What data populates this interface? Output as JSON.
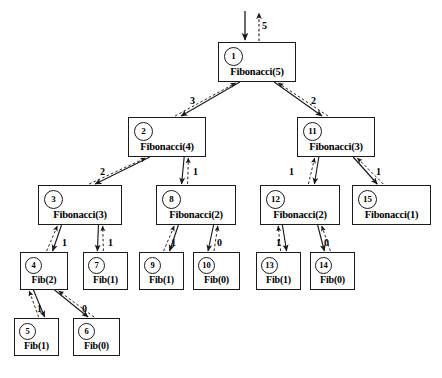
{
  "diagram": {
    "root_edge": {
      "label": "5",
      "call_direction": "down",
      "return_direction": "up"
    },
    "colors": {
      "stroke": "#1a1a1a",
      "background": "#ffffff",
      "text": "#000000"
    },
    "nodes": [
      {
        "id": "n1",
        "index": "1",
        "label": "Fibonacci(5)",
        "x": 218,
        "y": 42,
        "w": 78,
        "h": 40,
        "size": "big"
      },
      {
        "id": "n2",
        "index": "2",
        "label": "Fibonacci(4)",
        "x": 128,
        "y": 117,
        "w": 78,
        "h": 40,
        "size": "big"
      },
      {
        "id": "n11",
        "index": "11",
        "label": "Fibonacci(3)",
        "x": 297,
        "y": 117,
        "w": 78,
        "h": 40,
        "size": "big"
      },
      {
        "id": "n3",
        "index": "3",
        "label": "Fibonacci(3)",
        "x": 38,
        "y": 185,
        "w": 84,
        "h": 40,
        "size": "big"
      },
      {
        "id": "n8",
        "index": "8",
        "label": "Fibonacci(2)",
        "x": 156,
        "y": 185,
        "w": 80,
        "h": 40,
        "size": "big"
      },
      {
        "id": "n12",
        "index": "12",
        "label": "Fibonacci(2)",
        "x": 260,
        "y": 185,
        "w": 80,
        "h": 40,
        "size": "big"
      },
      {
        "id": "n15",
        "index": "15",
        "label": "Fibonacci(1)",
        "x": 352,
        "y": 185,
        "w": 79,
        "h": 40,
        "size": "big"
      },
      {
        "id": "n4",
        "index": "4",
        "label": "Fib(2)",
        "x": 20,
        "y": 252,
        "w": 48,
        "h": 38,
        "size": "small"
      },
      {
        "id": "n7",
        "index": "7",
        "label": "Fib(1)",
        "x": 83,
        "y": 252,
        "w": 45,
        "h": 38,
        "size": "small"
      },
      {
        "id": "n9",
        "index": "9",
        "label": "Fib(1)",
        "x": 139,
        "y": 252,
        "w": 45,
        "h": 38,
        "size": "small"
      },
      {
        "id": "n10",
        "index": "10",
        "label": "Fib(0)",
        "x": 193,
        "y": 252,
        "w": 47,
        "h": 38,
        "size": "small"
      },
      {
        "id": "n13",
        "index": "13",
        "label": "Fib(1)",
        "x": 256,
        "y": 252,
        "w": 45,
        "h": 38,
        "size": "small"
      },
      {
        "id": "n14",
        "index": "14",
        "label": "Fib(0)",
        "x": 310,
        "y": 252,
        "w": 45,
        "h": 38,
        "size": "small"
      },
      {
        "id": "n5",
        "index": "5",
        "label": "Fib(1)",
        "x": 14,
        "y": 318,
        "w": 45,
        "h": 38,
        "size": "small"
      },
      {
        "id": "n6",
        "index": "6",
        "label": "Fib(0)",
        "x": 73,
        "y": 318,
        "w": 47,
        "h": 38,
        "size": "small"
      }
    ],
    "edges": [
      {
        "from": "n1",
        "to": "n2",
        "label": "3",
        "lx": 190,
        "ly": 95
      },
      {
        "from": "n1",
        "to": "n11",
        "label": "2",
        "lx": 311,
        "ly": 95
      },
      {
        "from": "n2",
        "to": "n3",
        "label": "2",
        "lx": 100,
        "ly": 166
      },
      {
        "from": "n2",
        "to": "n8",
        "label": "1",
        "lx": 193,
        "ly": 166
      },
      {
        "from": "n11",
        "to": "n12",
        "label": "1",
        "lx": 289,
        "ly": 166
      },
      {
        "from": "n11",
        "to": "n15",
        "label": "1",
        "lx": 376,
        "ly": 166
      },
      {
        "from": "n3",
        "to": "n4",
        "label": "1",
        "lx": 62,
        "ly": 237
      },
      {
        "from": "n3",
        "to": "n7",
        "label": "1",
        "lx": 108,
        "ly": 237
      },
      {
        "from": "n8",
        "to": "n9",
        "label": "1",
        "lx": 171,
        "ly": 237
      },
      {
        "from": "n8",
        "to": "n10",
        "label": "0",
        "lx": 217,
        "ly": 237
      },
      {
        "from": "n12",
        "to": "n13",
        "label": "1",
        "lx": 276,
        "ly": 237
      },
      {
        "from": "n12",
        "to": "n14",
        "label": "0",
        "lx": 324,
        "ly": 237
      },
      {
        "from": "n4",
        "to": "n5",
        "label": "1",
        "lx": 37,
        "ly": 303
      },
      {
        "from": "n4",
        "to": "n6",
        "label": "0",
        "lx": 82,
        "ly": 303
      }
    ]
  }
}
